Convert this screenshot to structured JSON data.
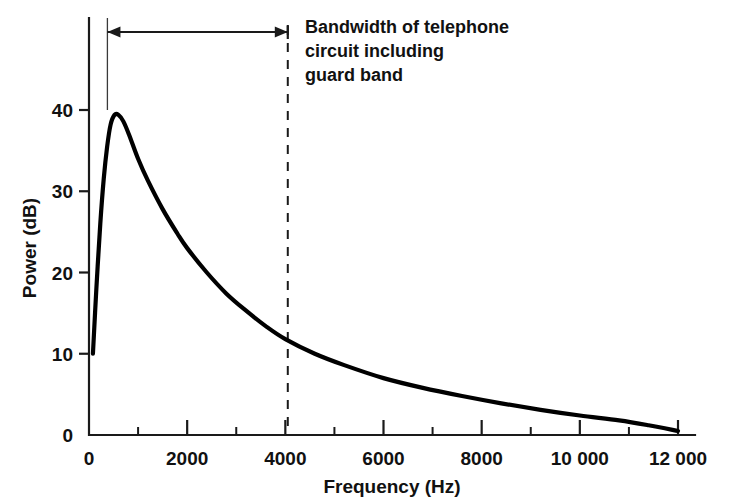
{
  "chart_data": {
    "type": "line",
    "title": "",
    "xlabel": "Frequency (Hz)",
    "ylabel": "Power (dB)",
    "xlim": [
      0,
      12000
    ],
    "ylim": [
      0,
      48
    ],
    "grid": false,
    "legend": "none",
    "x_ticks": [
      {
        "value": 0,
        "label": "0",
        "major": true
      },
      {
        "value": 1000,
        "label": "",
        "major": false
      },
      {
        "value": 2000,
        "label": "2000",
        "major": true
      },
      {
        "value": 3000,
        "label": "",
        "major": false
      },
      {
        "value": 4000,
        "label": "4000",
        "major": true
      },
      {
        "value": 5000,
        "label": "",
        "major": false
      },
      {
        "value": 6000,
        "label": "6000",
        "major": true
      },
      {
        "value": 7000,
        "label": "",
        "major": false
      },
      {
        "value": 8000,
        "label": "8000",
        "major": true
      },
      {
        "value": 9000,
        "label": "",
        "major": false
      },
      {
        "value": 10000,
        "label": "10 000",
        "major": true
      },
      {
        "value": 11000,
        "label": "",
        "major": false
      },
      {
        "value": 12000,
        "label": "12 000",
        "major": true
      }
    ],
    "y_ticks": [
      {
        "value": 0,
        "label": "0"
      },
      {
        "value": 10,
        "label": "10"
      },
      {
        "value": 20,
        "label": "20"
      },
      {
        "value": 30,
        "label": "30"
      },
      {
        "value": 40,
        "label": "40"
      }
    ],
    "series": [
      {
        "name": "speech power spectrum",
        "color": "#000000",
        "points": [
          [
            80,
            10.0
          ],
          [
            150,
            18.0
          ],
          [
            230,
            26.0
          ],
          [
            300,
            31.5
          ],
          [
            370,
            35.5
          ],
          [
            440,
            38.2
          ],
          [
            520,
            39.4
          ],
          [
            600,
            39.4
          ],
          [
            700,
            38.6
          ],
          [
            820,
            36.9
          ],
          [
            1000,
            34.0
          ],
          [
            1200,
            31.3
          ],
          [
            1500,
            27.8
          ],
          [
            1800,
            24.8
          ],
          [
            2000,
            23.0
          ],
          [
            2400,
            20.0
          ],
          [
            2800,
            17.4
          ],
          [
            3200,
            15.3
          ],
          [
            3600,
            13.4
          ],
          [
            4000,
            11.8
          ],
          [
            4600,
            10.0
          ],
          [
            5200,
            8.6
          ],
          [
            6000,
            7.0
          ],
          [
            6800,
            5.8
          ],
          [
            7600,
            4.8
          ],
          [
            8400,
            3.9
          ],
          [
            9200,
            3.1
          ],
          [
            10000,
            2.4
          ],
          [
            10800,
            1.8
          ],
          [
            11400,
            1.2
          ],
          [
            12000,
            0.5
          ]
        ]
      }
    ],
    "annotations": [
      {
        "name": "bandwidth-span",
        "kind": "double-arrow",
        "from_x": 375,
        "to_x": 4050,
        "at_y_px": 32,
        "lines": [
          "Bandwidth of telephone",
          "circuit including",
          "guard band"
        ]
      },
      {
        "name": "bandwidth-upper-marker",
        "kind": "vertical-guide",
        "x": 375
      },
      {
        "name": "bandwidth-limit-4000",
        "kind": "vertical-dashed",
        "x": 4050
      }
    ]
  },
  "axes": {
    "x_axis_title": "Frequency (Hz)",
    "y_axis_title": "Power (dB)"
  },
  "annotation": {
    "line1": "Bandwidth of telephone",
    "line2": "circuit including",
    "line3": "guard band"
  },
  "colors": {
    "curve": "#000000",
    "axis": "#1a1a1a",
    "background": "#ffffff"
  }
}
